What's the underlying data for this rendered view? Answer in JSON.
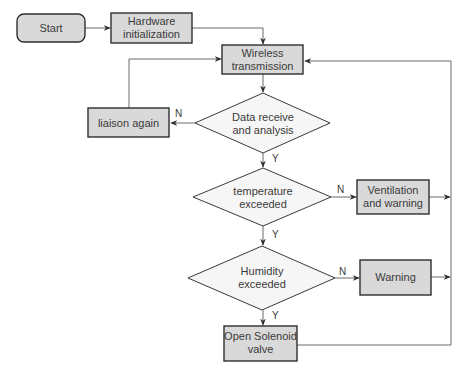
{
  "diagram": {
    "type": "flowchart",
    "nodes": {
      "start": {
        "label": "Start",
        "shape": "rounded-rect"
      },
      "hardware": {
        "label_line1": "Hardware",
        "label_line2": "initialization",
        "shape": "rect"
      },
      "wireless": {
        "label_line1": "Wireless",
        "label_line2": "transmission",
        "shape": "rect"
      },
      "data": {
        "label_line1": "Data receive",
        "label_line2": "and analysis",
        "shape": "diamond"
      },
      "liaison": {
        "label": "liaison again",
        "shape": "rect"
      },
      "temperature": {
        "label_line1": "temperature",
        "label_line2": "exceeded",
        "shape": "diamond"
      },
      "ventilation": {
        "label_line1": "Ventilation",
        "label_line2": "and warning",
        "shape": "rect"
      },
      "humidity": {
        "label_line1": "Humidity",
        "label_line2": "exceeded",
        "shape": "diamond"
      },
      "warning": {
        "label": "Warning",
        "shape": "rect"
      },
      "solenoid": {
        "label_line1": "Open Solenoid",
        "label_line2": "valve",
        "shape": "rect"
      }
    },
    "edge_labels": {
      "data_no": "N",
      "data_yes": "Y",
      "temperature_no": "N",
      "temperature_yes": "Y",
      "humidity_no": "N",
      "humidity_yes": "Y"
    },
    "edges": [
      {
        "from": "start",
        "to": "hardware"
      },
      {
        "from": "hardware",
        "to": "wireless"
      },
      {
        "from": "wireless",
        "to": "data"
      },
      {
        "from": "data",
        "to": "liaison",
        "label": "N"
      },
      {
        "from": "liaison",
        "to": "wireless"
      },
      {
        "from": "data",
        "to": "temperature",
        "label": "Y"
      },
      {
        "from": "temperature",
        "to": "ventilation",
        "label": "N"
      },
      {
        "from": "temperature",
        "to": "humidity",
        "label": "Y"
      },
      {
        "from": "ventilation",
        "to": "wireless"
      },
      {
        "from": "humidity",
        "to": "warning",
        "label": "N"
      },
      {
        "from": "humidity",
        "to": "solenoid",
        "label": "Y"
      },
      {
        "from": "warning",
        "to": "wireless"
      },
      {
        "from": "solenoid",
        "to": "wireless"
      }
    ],
    "colors": {
      "box_fill": "#d9d9d9",
      "diamond_fill": "#f6f6f6",
      "border": "#2e2e2e",
      "line": "#6a6a6a",
      "text": "#3a3a3a"
    }
  }
}
